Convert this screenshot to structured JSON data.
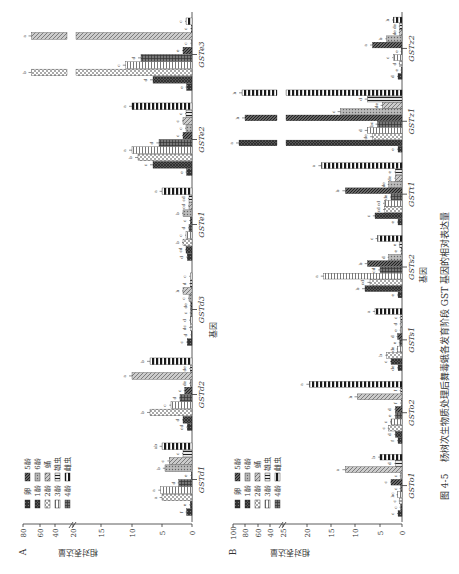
{
  "figure": {
    "caption_label": "图 4-5",
    "caption_text": "杨树次生物质处理后舞毒蛾各发育阶段 GST 基因的相对表达量",
    "orientation": "rotated 90° counter-clockwise"
  },
  "legend": {
    "items": [
      {
        "label": "卵",
        "pattern": "dots-dark"
      },
      {
        "label": "1龄",
        "pattern": "crosshatch-dark"
      },
      {
        "label": "2龄",
        "pattern": "checker-light"
      },
      {
        "label": "3龄",
        "pattern": "vertical-lines"
      },
      {
        "label": "4龄",
        "pattern": "grid-dark"
      },
      {
        "label": "5龄",
        "pattern": "diag-dense"
      },
      {
        "label": "6龄",
        "pattern": "dots-light"
      },
      {
        "label": "蛹",
        "pattern": "diag-light"
      },
      {
        "label": "雄虫",
        "pattern": "horizontal-lines"
      },
      {
        "label": "雌虫",
        "pattern": "thick-stripes"
      }
    ]
  },
  "chart_data": [
    {
      "panel": "A",
      "type": "bar",
      "title": "",
      "xlabel": "基因",
      "ylabel": "相对表达量",
      "ylim": [
        0,
        80
      ],
      "axis_break": [
        20,
        20
      ],
      "yticks": [
        "0",
        "5",
        "10",
        "15",
        "20",
        "40",
        "60",
        "80"
      ],
      "categories": [
        "GSTd1",
        "GSTd2",
        "GSTd3",
        "GSTe1",
        "GSTe2",
        "GSTe3"
      ],
      "series": [
        {
          "name": "卵",
          "values": [
            0.9,
            0.8,
            0.8,
            0.8,
            0.9,
            0.9
          ],
          "letters": [
            "f",
            "cd",
            "c",
            "d",
            "e",
            "e"
          ]
        },
        {
          "name": "1龄",
          "values": [
            0.3,
            1.5,
            0.1,
            1.0,
            6.5,
            6.5
          ],
          "letters": [
            "e",
            "d",
            "d",
            "cd",
            "c",
            "d"
          ]
        },
        {
          "name": "2龄",
          "values": [
            5.0,
            7.0,
            0.3,
            1.5,
            9.0,
            70.0
          ],
          "letters": [
            "a",
            "b",
            "dc",
            "b",
            "b",
            "b"
          ]
        },
        {
          "name": "3龄",
          "values": [
            5.2,
            3.5,
            0.3,
            1.0,
            10.0,
            11.0
          ],
          "letters": [
            "a",
            "c",
            "d",
            "c",
            "a",
            "c"
          ]
        },
        {
          "name": "4龄",
          "values": [
            2.2,
            2.0,
            0.2,
            0.5,
            5.5,
            8.5
          ],
          "letters": [
            "d",
            "d",
            "c",
            "d",
            "d",
            "d"
          ]
        },
        {
          "name": "5龄",
          "values": [
            0.1,
            1.2,
            0.2,
            0.3,
            1.5,
            1.5
          ],
          "letters": [
            "e",
            "c",
            "de",
            "c",
            "c",
            "e"
          ]
        },
        {
          "name": "6龄",
          "values": [
            4.5,
            0.3,
            0.5,
            1.5,
            1.0,
            0.1
          ],
          "letters": [
            "b",
            "de",
            "c",
            "b",
            "c",
            "c"
          ]
        },
        {
          "name": "蛹",
          "values": [
            3.8,
            10.0,
            1.5,
            0.5,
            1.5,
            70.0
          ],
          "letters": [
            "c",
            "a",
            "b",
            "cd",
            "c",
            "a"
          ]
        },
        {
          "name": "雄虫",
          "values": [
            1.5,
            0.3,
            0.3,
            0.5,
            1.0,
            0.1
          ],
          "letters": [
            "c",
            "de",
            "d",
            "cd",
            "c",
            "c"
          ]
        },
        {
          "name": "雌虫",
          "values": [
            5.0,
            7.0,
            0.3,
            5.0,
            10.0,
            1.0
          ],
          "letters": [
            "ab",
            "b",
            "c",
            "a",
            "a",
            "c"
          ]
        }
      ]
    },
    {
      "panel": "B",
      "type": "bar",
      "title": "",
      "xlabel": "基因",
      "ylabel": "相对表达量",
      "ylim": [
        0,
        100
      ],
      "axis_break": [
        25,
        40
      ],
      "yticks": [
        "0",
        "5",
        "10",
        "15",
        "20",
        "25",
        "40",
        "60",
        "80",
        "100"
      ],
      "categories": [
        "GSTo1",
        "GSTo2",
        "GSTs1",
        "GSTs2",
        "GSTt1",
        "GSTz1",
        "GSTz2"
      ],
      "series": [
        {
          "name": "卵",
          "values": [
            0.9,
            0.9,
            0.9,
            0.9,
            0.9,
            0.9,
            0.9
          ],
          "letters": [
            "c",
            "f",
            "de",
            "e",
            "e",
            "e",
            "d"
          ]
        },
        {
          "name": "1龄",
          "values": [
            0.3,
            1.5,
            2.5,
            8.0,
            6.0,
            90.0,
            0.1
          ],
          "letters": [
            "c",
            "d",
            "c",
            "b",
            "c",
            "a",
            "e"
          ]
        },
        {
          "name": "2龄",
          "values": [
            0.5,
            3.0,
            3.5,
            7.0,
            4.0,
            6.5,
            0.5
          ],
          "letters": [
            "c",
            "c",
            "b",
            "cd",
            "cd",
            "de",
            "d"
          ]
        },
        {
          "name": "3龄",
          "values": [
            1.0,
            2.5,
            1.0,
            16.5,
            4.0,
            7.5,
            2.0
          ],
          "letters": [
            "bc",
            "c",
            "de",
            "a",
            "cd",
            "d",
            "c"
          ]
        },
        {
          "name": "4龄",
          "values": [
            0.3,
            1.5,
            0.5,
            5.0,
            2.5,
            5.5,
            0.1
          ],
          "letters": [
            "c",
            "e",
            "e",
            "cd",
            "de",
            "bc",
            "e"
          ]
        },
        {
          "name": "5龄",
          "values": [
            2.5,
            1.5,
            1.0,
            7.5,
            12.0,
            80.0,
            6.5
          ],
          "letters": [
            "c",
            "d",
            "d",
            "b",
            "b",
            "b",
            "a"
          ]
        },
        {
          "name": "6龄",
          "values": [
            0.3,
            0.2,
            0.3,
            3.0,
            3.0,
            13.0,
            3.5
          ],
          "letters": [
            "c",
            "f",
            "e",
            "d",
            "de",
            "c",
            "b"
          ]
        },
        {
          "name": "蛹",
          "values": [
            12.0,
            9.5,
            0.3,
            0.2,
            1.5,
            4.5,
            0.5
          ],
          "letters": [
            "a",
            "b",
            "d",
            "e",
            "de",
            "de",
            "de"
          ]
        },
        {
          "name": "雄虫",
          "values": [
            1.5,
            0.3,
            0.3,
            0.5,
            1.5,
            7.5,
            0.5
          ],
          "letters": [
            "d",
            "f",
            "c",
            "e",
            "e",
            "d",
            "de"
          ]
        },
        {
          "name": "雌虫",
          "values": [
            5.0,
            19.5,
            6.0,
            5.5,
            17.0,
            85.0,
            2.0
          ],
          "letters": [
            "b",
            "a",
            "a",
            "c",
            "a",
            "b",
            "b"
          ]
        }
      ]
    }
  ]
}
